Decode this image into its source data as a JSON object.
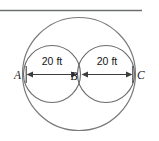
{
  "figure": {
    "background_color": "#ffffff",
    "line_color": "#58595b",
    "label_color": "#161617",
    "top_rule": {
      "name": "horizontal-rule",
      "x1": 0,
      "y1": 10,
      "x2": 142,
      "y2": 10
    },
    "large_circle": {
      "name": "large-circle",
      "cx": 79,
      "cy": 74,
      "r": 57
    },
    "small_circles": [
      {
        "name": "left-small-circle",
        "cx": 52,
        "cy": 74,
        "r": 28.5
      },
      {
        "name": "right-small-circle",
        "cx": 106,
        "cy": 74,
        "r": 28.5
      }
    ],
    "points": [
      {
        "id": "A",
        "label": "A",
        "x": 23,
        "y": 74
      },
      {
        "id": "B",
        "label": "B",
        "x": 79,
        "y": 74
      },
      {
        "id": "C",
        "label": "C",
        "x": 135,
        "y": 74
      }
    ],
    "dimensions": [
      {
        "id": "AB",
        "label": "20 ft",
        "from": "A",
        "to": "B",
        "value": 20,
        "unit": "ft"
      },
      {
        "id": "BC",
        "label": "20 ft",
        "from": "B",
        "to": "C",
        "value": 20,
        "unit": "ft"
      }
    ]
  }
}
